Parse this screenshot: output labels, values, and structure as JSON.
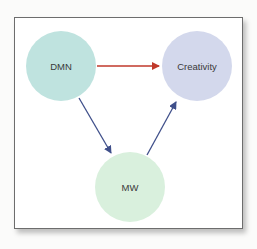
{
  "nodes": {
    "dmn": {
      "label": "DMN",
      "color": "#bfe3df"
    },
    "creativity": {
      "label": "Creativity",
      "color": "#d3d8ec"
    },
    "mw": {
      "label": "MW",
      "color": "#d9f0dd"
    }
  },
  "edges": [
    {
      "from": "DMN",
      "to": "Creativity",
      "color": "#c0392b"
    },
    {
      "from": "DMN",
      "to": "MW",
      "color": "#3f4f8a"
    },
    {
      "from": "MW",
      "to": "Creativity",
      "color": "#3f4f8a"
    }
  ]
}
